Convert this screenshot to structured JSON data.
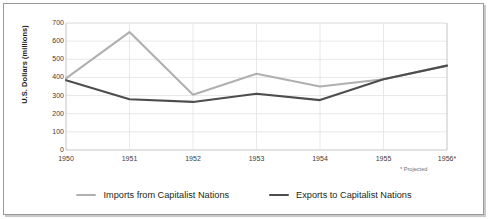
{
  "chart_data": {
    "type": "line",
    "title": "",
    "xlabel": "",
    "ylabel": "U.S. Dollars (millions)",
    "ylim": [
      0,
      700
    ],
    "ytick_values": [
      700,
      600,
      500,
      400,
      300,
      200,
      100,
      0
    ],
    "yticks": [
      "700",
      "600",
      "500",
      "400",
      "300",
      "200",
      "100",
      "0"
    ],
    "categories": [
      "1950",
      "1951",
      "1952",
      "1953",
      "1954",
      "1955",
      "1956*"
    ],
    "x": [
      1950,
      1951,
      1952,
      1953,
      1954,
      1955,
      1956
    ],
    "grid": true,
    "legend_position": "bottom",
    "footnote": "* Projected",
    "series": [
      {
        "name": "Imports from Capitalist Nations",
        "color": "#b0b0b0",
        "values": [
          395,
          650,
          305,
          420,
          350,
          390,
          465
        ]
      },
      {
        "name": "Exports to Capitalist Nations",
        "color": "#4d4d4d",
        "values": [
          385,
          280,
          265,
          310,
          275,
          390,
          465
        ]
      }
    ]
  },
  "legend": {
    "items": [
      {
        "label": "Imports from Capitalist Nations",
        "color": "#b0b0b0"
      },
      {
        "label": "Exports to Capitalist Nations",
        "color": "#4d4d4d"
      }
    ]
  },
  "axes": {
    "y_title": "U.S. Dollars (millions)",
    "footnote": "* Projected"
  },
  "colors": {
    "imports": "#b0b0b0",
    "exports": "#4d4d4d",
    "grid": "#e2e2e2",
    "axis": "#bdbdbd",
    "frame": "#9a9a9a",
    "text": "#3b3b3b"
  }
}
